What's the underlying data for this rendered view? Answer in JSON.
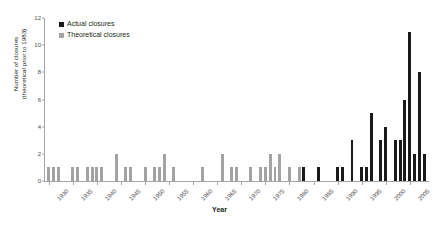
{
  "legend": {
    "position": "top-left",
    "items": [
      {
        "label": "Actual closures",
        "key": "actual",
        "color": "#1a1a1a"
      },
      {
        "label": "Theoretical closures",
        "key": "theoretical",
        "color": "#a3a3a3"
      }
    ]
  },
  "axes": {
    "ylabel_line1": "Number of closures",
    "ylabel_line2": "(theoretical prior to 1983)",
    "xlabel": "Year"
  },
  "chart_data": {
    "type": "bar",
    "title": "",
    "xlabel": "Year",
    "ylabel": "Number of closures (theoretical prior to 1983)",
    "ylim": [
      0,
      12
    ],
    "yticks": [
      0,
      2,
      4,
      6,
      8,
      10,
      12
    ],
    "xlim": [
      1929,
      2009
    ],
    "xticks": [
      1930,
      1935,
      1940,
      1945,
      1950,
      1955,
      1960,
      1965,
      1970,
      1975,
      1980,
      1985,
      1990,
      1995,
      2000,
      2005
    ],
    "grid": false,
    "legend_position": "upper left",
    "series": [
      {
        "name": "Theoretical closures",
        "color": "#a3a3a3"
      },
      {
        "name": "Actual closures",
        "color": "#1a1a1a"
      }
    ],
    "categories": [
      1930,
      1931,
      1932,
      1933,
      1934,
      1935,
      1936,
      1937,
      1938,
      1939,
      1940,
      1941,
      1942,
      1943,
      1944,
      1945,
      1946,
      1947,
      1948,
      1949,
      1950,
      1951,
      1952,
      1953,
      1954,
      1955,
      1956,
      1957,
      1958,
      1959,
      1960,
      1961,
      1962,
      1963,
      1964,
      1965,
      1966,
      1967,
      1968,
      1969,
      1970,
      1971,
      1972,
      1973,
      1974,
      1975,
      1976,
      1977,
      1978,
      1979,
      1980,
      1981,
      1982,
      1983,
      1984,
      1985,
      1986,
      1987,
      1988,
      1989,
      1990,
      1991,
      1992,
      1993,
      1994,
      1995,
      1996,
      1997,
      1998,
      1999,
      2000,
      2001,
      2002,
      2003,
      2004,
      2005,
      2006,
      2007,
      2008
    ],
    "values": [
      1,
      1,
      1,
      0,
      0,
      1,
      1,
      0,
      1,
      1,
      1,
      1,
      0,
      0,
      2,
      0,
      1,
      1,
      0,
      0,
      1,
      0,
      1,
      1,
      2,
      0,
      1,
      0,
      0,
      0,
      0,
      0,
      1,
      0,
      0,
      0,
      2,
      0,
      1,
      1,
      0,
      0,
      1,
      0,
      1,
      1,
      2,
      1,
      2,
      0,
      1,
      0,
      1,
      1,
      0,
      0,
      1,
      0,
      0,
      0,
      1,
      1,
      0,
      3,
      0,
      1,
      1,
      5,
      0,
      3,
      4,
      0,
      3,
      3,
      6,
      11,
      2,
      8,
      2
    ],
    "bar_kinds": [
      "theoretical",
      "theoretical",
      "theoretical",
      "theoretical",
      "theoretical",
      "theoretical",
      "theoretical",
      "theoretical",
      "theoretical",
      "theoretical",
      "theoretical",
      "theoretical",
      "theoretical",
      "theoretical",
      "theoretical",
      "theoretical",
      "theoretical",
      "theoretical",
      "theoretical",
      "theoretical",
      "theoretical",
      "theoretical",
      "theoretical",
      "theoretical",
      "theoretical",
      "theoretical",
      "theoretical",
      "theoretical",
      "theoretical",
      "theoretical",
      "theoretical",
      "theoretical",
      "theoretical",
      "theoretical",
      "theoretical",
      "theoretical",
      "theoretical",
      "theoretical",
      "theoretical",
      "theoretical",
      "theoretical",
      "theoretical",
      "theoretical",
      "theoretical",
      "theoretical",
      "theoretical",
      "theoretical",
      "theoretical",
      "theoretical",
      "theoretical",
      "theoretical",
      "theoretical",
      "theoretical",
      "actual",
      "actual",
      "actual",
      "actual",
      "actual",
      "actual",
      "actual",
      "actual",
      "actual",
      "actual",
      "actual",
      "actual",
      "actual",
      "actual",
      "actual",
      "actual",
      "actual",
      "actual",
      "actual",
      "actual",
      "actual",
      "actual",
      "actual",
      "actual",
      "actual",
      "actual"
    ]
  }
}
